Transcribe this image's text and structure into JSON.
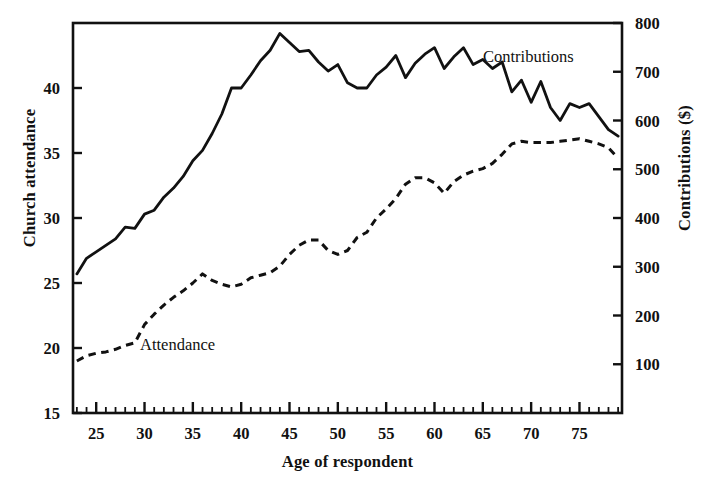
{
  "chart_data": {
    "type": "line",
    "title": "",
    "xlabel": "Age of respondent",
    "ylabel": "Church attendance",
    "ylabel_right": "Contributions ($)",
    "xlim": [
      22.6,
      79.4
    ],
    "ylim": [
      15,
      45
    ],
    "ylim_right": [
      0,
      800
    ],
    "grid": false,
    "legend_position": "inline-annotations",
    "xticks": [
      25,
      30,
      35,
      40,
      45,
      50,
      55,
      60,
      65,
      70,
      75
    ],
    "xticks_minor_step": 1,
    "yticks_left": [
      15,
      20,
      25,
      30,
      35,
      40
    ],
    "yticks_right": [
      100,
      200,
      300,
      400,
      500,
      600,
      700,
      800
    ],
    "x": [
      23,
      24,
      25,
      26,
      27,
      28,
      29,
      30,
      31,
      32,
      33,
      34,
      35,
      36,
      37,
      38,
      39,
      40,
      41,
      42,
      43,
      44,
      45,
      46,
      47,
      48,
      49,
      50,
      51,
      52,
      53,
      54,
      55,
      56,
      57,
      58,
      59,
      60,
      61,
      62,
      63,
      64,
      65,
      66,
      67,
      68,
      69,
      70,
      71,
      72,
      73,
      74,
      75,
      76,
      77,
      78,
      79
    ],
    "series": [
      {
        "name": "Contributions",
        "axis": "right",
        "style": "solid",
        "color": "#111111",
        "annotation": "Contributions",
        "values_left_scale": [
          25.7,
          26.9,
          27.4,
          27.9,
          28.4,
          29.3,
          29.2,
          30.3,
          30.6,
          31.6,
          32.3,
          33.2,
          34.4,
          35.2,
          36.5,
          38.0,
          40.0,
          40.0,
          41.0,
          42.1,
          42.9,
          44.2,
          43.5,
          42.8,
          42.9,
          42.0,
          41.3,
          41.8,
          40.4,
          40.0,
          40.0,
          41.0,
          41.6,
          42.5,
          40.8,
          41.9,
          42.6,
          43.1,
          41.5,
          42.4,
          43.1,
          41.8,
          42.2,
          41.5,
          42.0,
          39.7,
          40.6,
          38.9,
          40.5,
          38.5,
          37.5,
          38.8,
          38.5,
          38.8,
          37.8,
          36.8,
          36.3
        ],
        "values": [
          287,
          318,
          332,
          344,
          358,
          382,
          379,
          408,
          416,
          443,
          462,
          485,
          517,
          538,
          573,
          613,
          667,
          667,
          693,
          723,
          744,
          779,
          761,
          742,
          744,
          720,
          701,
          715,
          677,
          667,
          667,
          693,
          709,
          733,
          688,
          717,
          736,
          749,
          707,
          731,
          749,
          715,
          725,
          707,
          720,
          659,
          685,
          640,
          683,
          629,
          602,
          637,
          629,
          637,
          610,
          584,
          571
        ]
      },
      {
        "name": "Attendance",
        "axis": "left",
        "style": "dashed",
        "color": "#111111",
        "annotation": "Attendance",
        "values": [
          19.0,
          19.4,
          19.6,
          19.7,
          19.9,
          20.2,
          20.4,
          21.8,
          22.6,
          23.3,
          23.9,
          24.4,
          25.0,
          25.7,
          25.2,
          24.9,
          24.7,
          24.9,
          25.4,
          25.6,
          25.8,
          26.3,
          27.2,
          27.9,
          28.3,
          28.3,
          27.5,
          27.2,
          27.5,
          28.5,
          28.9,
          30.0,
          30.7,
          31.5,
          32.6,
          33.1,
          33.1,
          32.7,
          31.9,
          32.8,
          33.3,
          33.6,
          33.8,
          34.2,
          34.9,
          35.7,
          35.9,
          35.8,
          35.8,
          35.8,
          35.9,
          36.0,
          36.1,
          35.9,
          35.7,
          35.4,
          34.6
        ]
      }
    ]
  },
  "annotations": {
    "contributions": "Contributions",
    "attendance": "Attendance"
  },
  "axes": {
    "left_title": "Church attendance",
    "right_title": "Contributions ($)",
    "bottom_title": "Age of respondent"
  }
}
